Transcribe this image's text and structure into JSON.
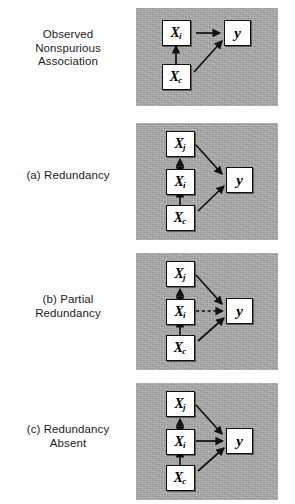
{
  "figure": {
    "background": "#ffffff",
    "panel_background": "#a9a9a9",
    "node_fill": "#ffffff",
    "node_stroke": "#111111",
    "arrow_color": "#111111",
    "rows": [
      {
        "id": "observed-nonspurious-association",
        "label_lines": [
          "Observed",
          "Nonspurious",
          "Association"
        ],
        "nodes": [
          {
            "id": "xi",
            "base": "X",
            "sub": "i"
          },
          {
            "id": "xc",
            "base": "X",
            "sub": "c"
          },
          {
            "id": "y",
            "base": "y",
            "sub": ""
          }
        ],
        "edges": [
          {
            "from": "xi",
            "to": "y",
            "style": "solid",
            "heads": "single"
          },
          {
            "from": "xc",
            "to": "xi",
            "style": "solid",
            "heads": "single"
          },
          {
            "from": "xc",
            "to": "y",
            "style": "solid",
            "heads": "single"
          }
        ]
      },
      {
        "id": "redundancy",
        "label_lines": [
          "(a) Redundancy"
        ],
        "nodes": [
          {
            "id": "xj",
            "base": "X",
            "sub": "j"
          },
          {
            "id": "xi",
            "base": "X",
            "sub": "i"
          },
          {
            "id": "xc",
            "base": "X",
            "sub": "c"
          },
          {
            "id": "y",
            "base": "y",
            "sub": ""
          }
        ],
        "edges": [
          {
            "from": "xj",
            "to": "y",
            "style": "solid",
            "heads": "single"
          },
          {
            "from": "xj",
            "to": "xi",
            "style": "solid",
            "heads": "double"
          },
          {
            "from": "xc",
            "to": "xi",
            "style": "solid",
            "heads": "single"
          },
          {
            "from": "xc",
            "to": "y",
            "style": "solid",
            "heads": "single"
          }
        ]
      },
      {
        "id": "partial-redundancy",
        "label_lines": [
          "(b) Partial",
          "Redundancy"
        ],
        "nodes": [
          {
            "id": "xj",
            "base": "X",
            "sub": "j"
          },
          {
            "id": "xi",
            "base": "X",
            "sub": "i"
          },
          {
            "id": "xc",
            "base": "X",
            "sub": "c"
          },
          {
            "id": "y",
            "base": "y",
            "sub": ""
          }
        ],
        "edges": [
          {
            "from": "xj",
            "to": "y",
            "style": "solid",
            "heads": "single"
          },
          {
            "from": "xj",
            "to": "xi",
            "style": "solid",
            "heads": "double"
          },
          {
            "from": "xi",
            "to": "y",
            "style": "dashed",
            "heads": "single"
          },
          {
            "from": "xc",
            "to": "xi",
            "style": "solid",
            "heads": "single"
          },
          {
            "from": "xc",
            "to": "y",
            "style": "solid",
            "heads": "single"
          }
        ]
      },
      {
        "id": "redundancy-absent",
        "label_lines": [
          "(c) Redundancy",
          "Absent"
        ],
        "nodes": [
          {
            "id": "xj",
            "base": "X",
            "sub": "j"
          },
          {
            "id": "xi",
            "base": "X",
            "sub": "i"
          },
          {
            "id": "xc",
            "base": "X",
            "sub": "c"
          },
          {
            "id": "y",
            "base": "y",
            "sub": ""
          }
        ],
        "edges": [
          {
            "from": "xj",
            "to": "y",
            "style": "solid",
            "heads": "single"
          },
          {
            "from": "xj",
            "to": "xi",
            "style": "solid",
            "heads": "double"
          },
          {
            "from": "xi",
            "to": "y",
            "style": "solid",
            "heads": "single"
          },
          {
            "from": "xc",
            "to": "xi",
            "style": "solid",
            "heads": "single"
          },
          {
            "from": "xc",
            "to": "y",
            "style": "solid",
            "heads": "single"
          }
        ]
      }
    ]
  }
}
